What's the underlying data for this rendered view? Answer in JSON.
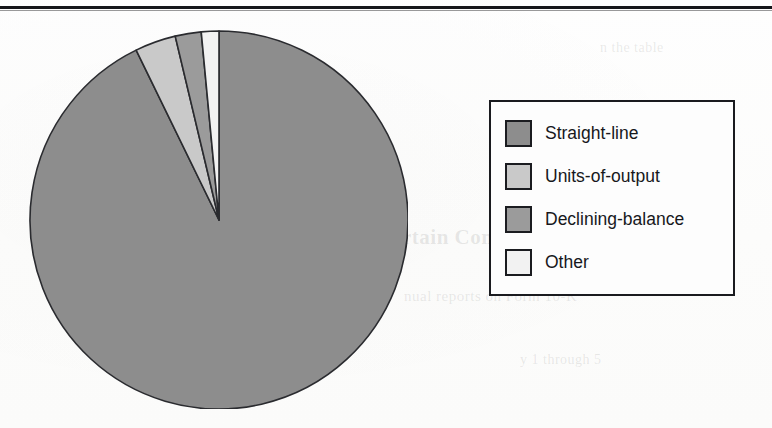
{
  "page": {
    "kind": "scanned-book-figure",
    "background_color": "#fdfdfc",
    "rule_color": "#15161a",
    "ghost_text": [
      "rtain Commonly Used Methods",
      "nual reports on Form 10-K",
      "are used by each",
      "y 1 through 5",
      "n the table"
    ]
  },
  "legend": {
    "border_color": "#1a1b1f",
    "background_color": "#fdfdfd",
    "items": [
      {
        "label": "Straight-line",
        "color": "#8d8d8d"
      },
      {
        "label": "Units-of-output",
        "color": "#c9c9c9"
      },
      {
        "label": "Declining-balance",
        "color": "#9b9b9b"
      },
      {
        "label": "Other",
        "color": "#f2f2f2"
      }
    ]
  },
  "chart_data": {
    "type": "pie",
    "title": "",
    "labels": [
      "Straight-line",
      "Units-of-output",
      "Declining-balance",
      "Other"
    ],
    "values": [
      92.8,
      3.5,
      2.2,
      1.5
    ],
    "unit": "percent",
    "colors": [
      "#8d8d8d",
      "#c9c9c9",
      "#9b9b9b",
      "#f2f2f2"
    ],
    "slice_order": "clockwise-from-12-oclock for Straight-line; remaining slices fill counterclockwise from 12 o'clock",
    "start_angle_deg": 0,
    "slice_angles_deg": [
      334.0,
      12.6,
      8.0,
      5.4
    ],
    "stroke_color": "#2a2b2f",
    "legend_position": "right",
    "center": {
      "cx": 218,
      "cy": 219
    },
    "radius": 189,
    "labels_shown_on_slices": false,
    "grid": false
  }
}
